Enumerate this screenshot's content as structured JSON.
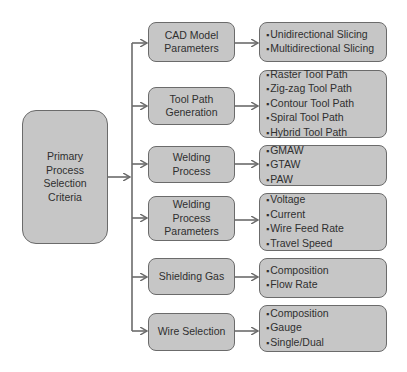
{
  "root": {
    "label": "Primary Process Selection Criteria",
    "lines": [
      "Primary",
      "Process",
      "Selection",
      "Criteria"
    ]
  },
  "categories": [
    {
      "label": "CAD Model Parameters",
      "lines": [
        "CAD Model",
        "Parameters"
      ],
      "items": [
        "Unidirectional Slicing",
        "Multidirectional Slicing"
      ]
    },
    {
      "label": "Tool Path Generation",
      "lines": [
        "Tool Path",
        "Generation"
      ],
      "items": [
        "Raster Tool Path",
        "Zig-zag Tool Path",
        "Contour Tool Path",
        "Spiral Tool Path",
        "Hybrid Tool Path"
      ]
    },
    {
      "label": "Welding Process",
      "lines": [
        "Welding",
        "Process"
      ],
      "items": [
        "GMAW",
        "GTAW",
        "PAW"
      ]
    },
    {
      "label": "Welding Process Parameters",
      "lines": [
        "Welding",
        "Process",
        "Parameters"
      ],
      "items": [
        "Voltage",
        "Current",
        "Wire Feed Rate",
        "Travel Speed"
      ]
    },
    {
      "label": "Shielding Gas",
      "lines": [
        "Shielding Gas"
      ],
      "items": [
        "Composition",
        "Flow Rate"
      ]
    },
    {
      "label": "Wire Selection",
      "lines": [
        "Wire Selection"
      ],
      "items": [
        "Composition",
        "Gauge",
        "Single/Dual"
      ]
    }
  ],
  "colors": {
    "box_fill": "#c6c6c6",
    "box_border": "#6b6b6b",
    "connector": "#6b6b6b",
    "text": "#2f2f2f"
  }
}
